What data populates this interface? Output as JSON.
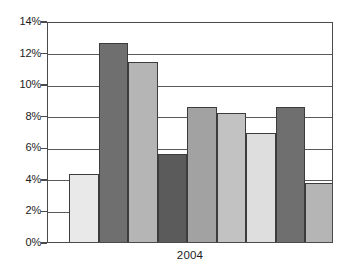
{
  "chart_data": {
    "type": "bar",
    "title": "",
    "subtitle": "",
    "xlabel": "2004",
    "ylabel": "",
    "ylim": [
      0,
      14
    ],
    "ytick_step": 2,
    "ytick_labels": [
      "0%",
      "2%",
      "4%",
      "6%",
      "8%",
      "10%",
      "12%",
      "14%"
    ],
    "ytick_values": [
      0,
      2,
      4,
      6,
      8,
      10,
      12,
      14
    ],
    "grid": true,
    "grid_axis": "y",
    "legend": false,
    "legend_position": "none",
    "categories": [
      "1",
      "2",
      "3",
      "4",
      "5",
      "6",
      "7",
      "8",
      "9"
    ],
    "values": [
      4.3,
      12.6,
      11.4,
      5.6,
      8.55,
      8.2,
      6.9,
      8.55,
      3.75
    ],
    "bar_colors": [
      "#e9e9e9",
      "#6f6f6f",
      "#b5b5b5",
      "#5b5b5b",
      "#a2a2a2",
      "#c2c2c2",
      "#dedede",
      "#6f6f6f",
      "#b5b5b5"
    ],
    "bar_border_color": "#3c3c3c",
    "axis_color": "#4a4a4a",
    "gridline_color": "#5a5a5a",
    "background_color": "#ffffff",
    "annotations": []
  }
}
